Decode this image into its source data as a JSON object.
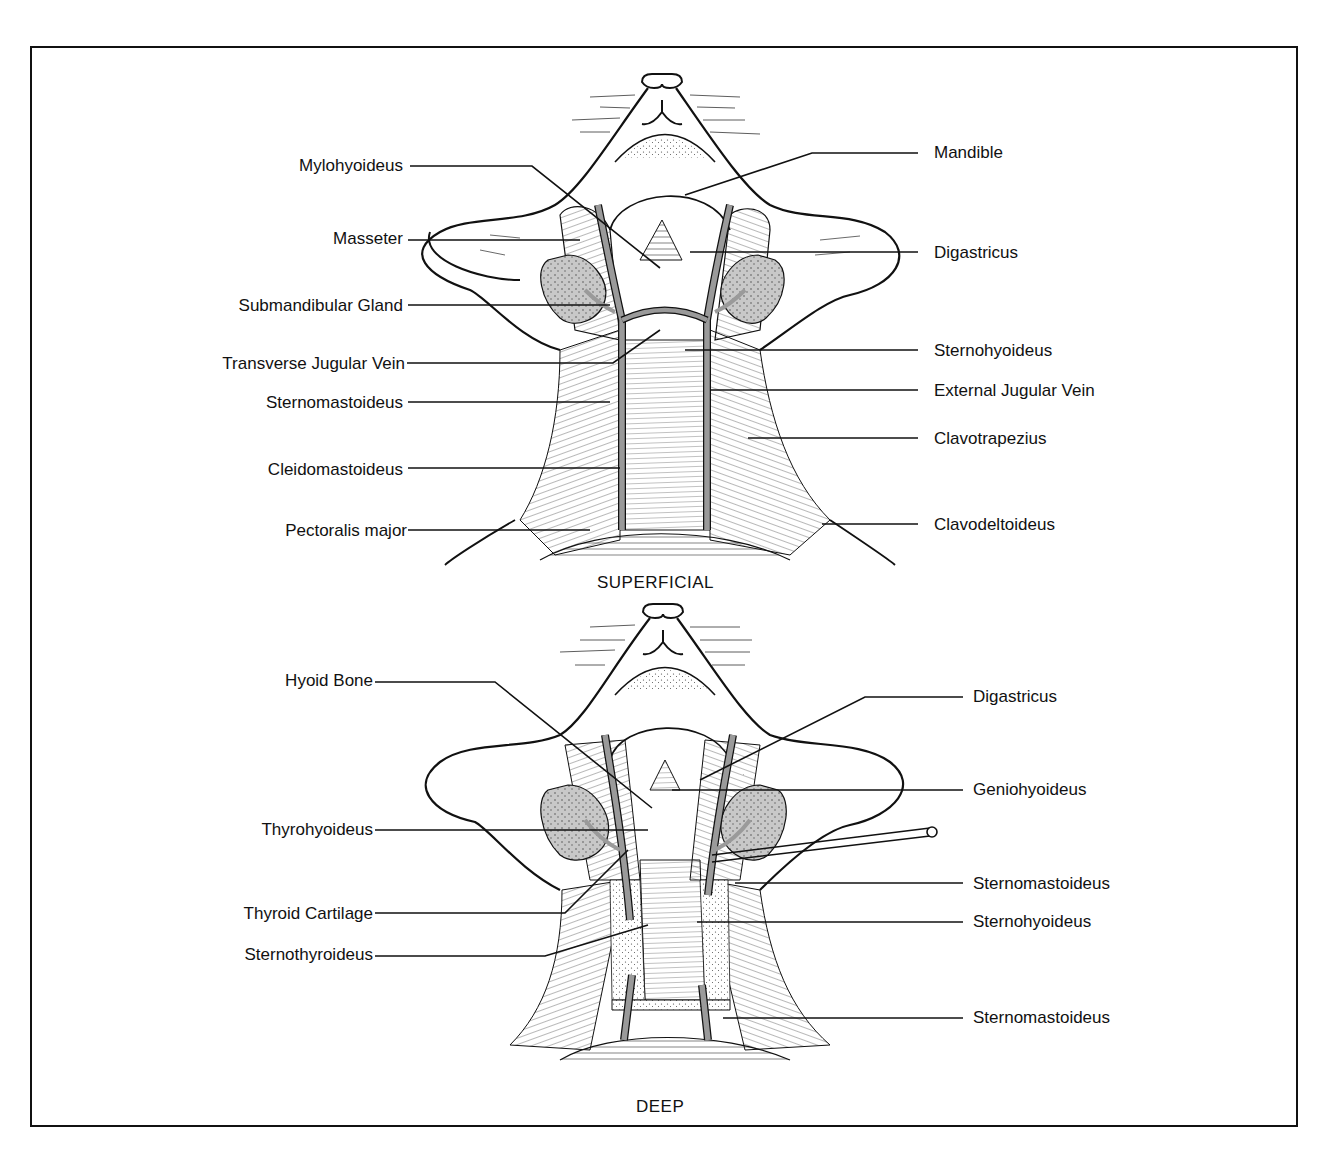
{
  "figure": {
    "panels": [
      {
        "id": "superficial",
        "caption": "SUPERFICIAL",
        "labels_left": [
          {
            "text": "Mylohyoideus"
          },
          {
            "text": "Masseter"
          },
          {
            "text": "Submandibular Gland"
          },
          {
            "text": "Transverse Jugular Vein"
          },
          {
            "text": "Sternomastoideus"
          },
          {
            "text": "Cleidomastoideus"
          },
          {
            "text": "Pectoralis major"
          }
        ],
        "labels_right": [
          {
            "text": "Mandible"
          },
          {
            "text": "Digastricus"
          },
          {
            "text": "Sternohyoideus"
          },
          {
            "text": "External Jugular Vein"
          },
          {
            "text": "Clavotrapezius"
          },
          {
            "text": "Clavodeltoideus"
          }
        ]
      },
      {
        "id": "deep",
        "caption": "DEEP",
        "labels_left": [
          {
            "text": "Hyoid Bone"
          },
          {
            "text": "Thyrohyoideus"
          },
          {
            "text": "Thyroid Cartilage"
          },
          {
            "text": "Sternothyroideus"
          }
        ],
        "labels_right": [
          {
            "text": "Digastricus"
          },
          {
            "text": "Geniohyoideus"
          },
          {
            "text": "Sternomastoideus"
          },
          {
            "text": "Sternohyoideus"
          },
          {
            "text": "Sternomastoideus"
          }
        ]
      }
    ],
    "colors": {
      "ink": "#111111",
      "vein_fill": "#9a9a9a",
      "gland_fill": "#c8c8c8",
      "background": "#ffffff"
    }
  }
}
